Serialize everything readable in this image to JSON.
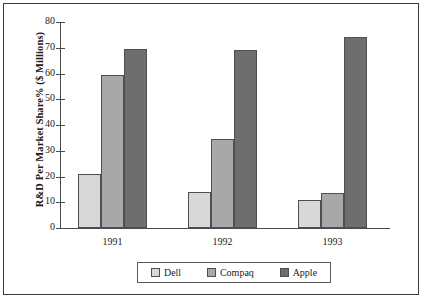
{
  "chart_data": {
    "type": "bar",
    "title": "",
    "xlabel": "",
    "ylabel": "R&D Per Market Share% ($ Millions)",
    "categories": [
      "1991",
      "1992",
      "1993"
    ],
    "series": [
      {
        "name": "Dell",
        "values": [
          21,
          14,
          11
        ],
        "color": "#d8d8d8"
      },
      {
        "name": "Compaq",
        "values": [
          59.5,
          34.5,
          13.5
        ],
        "color": "#a8a8a8"
      },
      {
        "name": "Apple",
        "values": [
          69.5,
          69,
          74
        ],
        "color": "#6e6e6e"
      }
    ],
    "ylim": [
      0,
      80
    ],
    "yticks": [
      0,
      10,
      20,
      30,
      40,
      50,
      60,
      70,
      80
    ],
    "ytick_labels": [
      "0",
      "10",
      "20",
      "30",
      "40",
      "50",
      "60",
      "70",
      "80"
    ],
    "grid": false,
    "legend_position": "bottom",
    "legend_entries": [
      "Dell",
      "Compaq",
      "Apple"
    ],
    "border": true,
    "axis_color": "#4a4a4a"
  }
}
